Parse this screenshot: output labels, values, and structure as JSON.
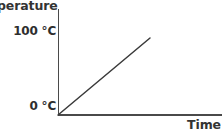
{
  "chart_data": {
    "type": "line",
    "title": "",
    "xlabel": "Time",
    "ylabel": "Temperature",
    "ylabel_rendered": "mperature",
    "ytick_labels": [
      "100 °C",
      "0 °C"
    ],
    "ytick_values": [
      100,
      0
    ],
    "xtick_labels": [],
    "grid": false,
    "legend": false,
    "ylim": [
      0,
      130
    ],
    "xlim": [
      0,
      100
    ],
    "series": [
      {
        "name": "Temperature",
        "x": [
          0,
          100
        ],
        "y": [
          0,
          100
        ],
        "color": "#3a3a3a",
        "style": "solid"
      }
    ],
    "annotations": [],
    "axis_color": "#4a4a4a",
    "background": "#ffffff"
  },
  "axes": {
    "y_title": "mperature",
    "x_title": "Time",
    "tick_top": "100 °C",
    "tick_bottom": "0 °C"
  }
}
